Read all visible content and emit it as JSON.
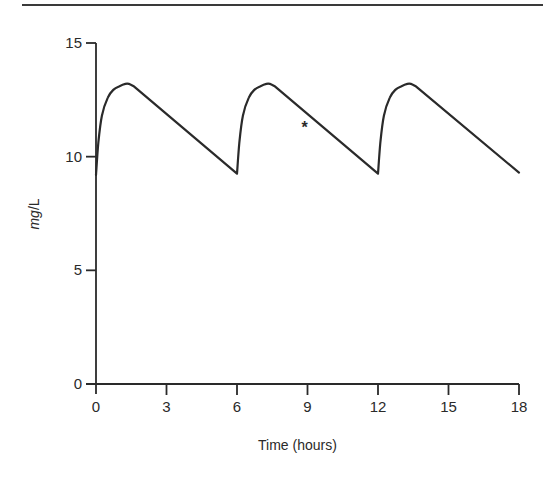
{
  "chart_data": {
    "type": "line",
    "title": "",
    "xlabel": "Time (hours)",
    "ylabel": "mg/L",
    "ylabel_parts": {
      "unit_num": "mg",
      "sep": "/",
      "unit_den": "L"
    },
    "xlim": [
      0,
      18
    ],
    "ylim": [
      0,
      15
    ],
    "x_ticks": [
      0,
      3,
      6,
      9,
      12,
      15,
      18
    ],
    "x_tick_labels": [
      "0",
      "3",
      "6",
      "9",
      "12",
      "15",
      "18"
    ],
    "y_ticks": [
      0,
      5,
      10,
      15
    ],
    "y_tick_labels": [
      "0",
      "5",
      "10",
      "15"
    ],
    "grid": false,
    "legend": null,
    "series": [
      {
        "name": "Plasma concentration",
        "x": [
          0,
          0.1,
          0.25,
          0.5,
          0.75,
          1.0,
          1.25,
          1.4,
          1.6,
          6.0,
          6.1,
          6.25,
          6.5,
          6.75,
          7.0,
          7.25,
          7.4,
          7.6,
          12.0,
          12.1,
          12.25,
          12.5,
          12.75,
          13.0,
          13.25,
          13.4,
          13.6,
          18.0
        ],
        "values": [
          9.2,
          10.6,
          11.8,
          12.6,
          12.95,
          13.1,
          13.2,
          13.2,
          13.1,
          9.25,
          10.6,
          11.8,
          12.6,
          12.95,
          13.1,
          13.2,
          13.2,
          13.1,
          9.25,
          10.6,
          11.8,
          12.6,
          12.95,
          13.1,
          13.2,
          13.2,
          13.1,
          9.3
        ]
      }
    ],
    "annotations": [
      {
        "text": "*",
        "x": 9.0,
        "y": 11.3
      }
    ]
  },
  "labels": {
    "xlabel": "Time (hours)",
    "ylabel_num": "mg",
    "ylabel_sep": "/",
    "ylabel_den": "L",
    "asterisk": "*"
  }
}
